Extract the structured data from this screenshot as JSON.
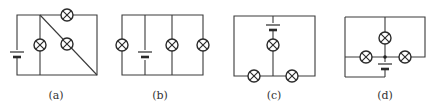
{
  "figure": {
    "diagrams": [
      {
        "id": "a",
        "label": "(a)",
        "lamps": 3,
        "batteries": 1
      },
      {
        "id": "b",
        "label": "(b)",
        "lamps": 3,
        "batteries": 1
      },
      {
        "id": "c",
        "label": "(c)",
        "lamps": 3,
        "batteries": 1
      },
      {
        "id": "d",
        "label": "(d)",
        "lamps": 3,
        "batteries": 1
      }
    ]
  }
}
